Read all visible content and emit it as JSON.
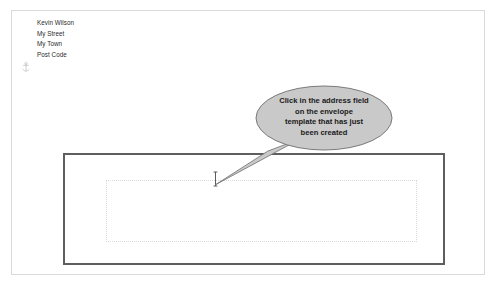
{
  "document": {
    "return_address": {
      "lines": [
        "Kevin Wilson",
        "My Street",
        "My Town",
        "Post Code"
      ]
    },
    "anchor_icon": "anchor-icon",
    "envelope": {
      "address_field_placeholder": ""
    },
    "caret": {
      "icon": "text-caret-icon"
    }
  },
  "callout": {
    "lines": [
      "Click in the address field",
      "on the envelope",
      "template that has just",
      "been created"
    ],
    "fill_color": "#c9c9c9",
    "stroke_color": "#6e6e6e"
  },
  "colors": {
    "page_background": "#ffffff",
    "page_border": "#d9d9d9",
    "envelope_border": "#5e5e5e",
    "address_field_border": "#dadada",
    "text": "#2b2b2b"
  }
}
